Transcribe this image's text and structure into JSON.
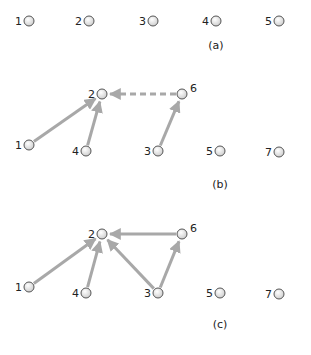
{
  "diagram": {
    "panels": [
      {
        "caption": "(a)",
        "nodes": [
          {
            "id": "1",
            "x": 29,
            "y": 21
          },
          {
            "id": "2",
            "x": 89,
            "y": 21
          },
          {
            "id": "3",
            "x": 153,
            "y": 21
          },
          {
            "id": "4",
            "x": 216,
            "y": 21
          },
          {
            "id": "5",
            "x": 279,
            "y": 21
          }
        ],
        "edges": []
      },
      {
        "caption": "(b)",
        "nodes": [
          {
            "id": "2",
            "x": 102,
            "y": 94
          },
          {
            "id": "6",
            "x": 182,
            "y": 94
          },
          {
            "id": "1",
            "x": 29,
            "y": 145
          },
          {
            "id": "4",
            "x": 86,
            "y": 151
          },
          {
            "id": "3",
            "x": 158,
            "y": 151
          },
          {
            "id": "5",
            "x": 220,
            "y": 151
          },
          {
            "id": "7",
            "x": 279,
            "y": 152
          }
        ],
        "edges": [
          {
            "from": "1",
            "to": "2",
            "style": "solid"
          },
          {
            "from": "4",
            "to": "2",
            "style": "solid"
          },
          {
            "from": "3",
            "to": "6",
            "style": "solid"
          },
          {
            "from": "6",
            "to": "2",
            "style": "dashed"
          }
        ]
      },
      {
        "caption": "(c)",
        "nodes": [
          {
            "id": "2",
            "x": 102,
            "y": 234
          },
          {
            "id": "6",
            "x": 182,
            "y": 234
          },
          {
            "id": "1",
            "x": 29,
            "y": 287
          },
          {
            "id": "4",
            "x": 86,
            "y": 293
          },
          {
            "id": "3",
            "x": 158,
            "y": 293
          },
          {
            "id": "5",
            "x": 220,
            "y": 293
          },
          {
            "id": "7",
            "x": 279,
            "y": 294
          }
        ],
        "edges": [
          {
            "from": "1",
            "to": "2",
            "style": "solid"
          },
          {
            "from": "4",
            "to": "2",
            "style": "solid"
          },
          {
            "from": "3",
            "to": "2",
            "style": "solid"
          },
          {
            "from": "3",
            "to": "6",
            "style": "solid"
          },
          {
            "from": "6",
            "to": "2",
            "style": "solid"
          }
        ]
      }
    ],
    "colors": {
      "edge": "#a8a8a8",
      "node_fill": "#f2f2f2",
      "node_stroke": "#555555"
    }
  }
}
